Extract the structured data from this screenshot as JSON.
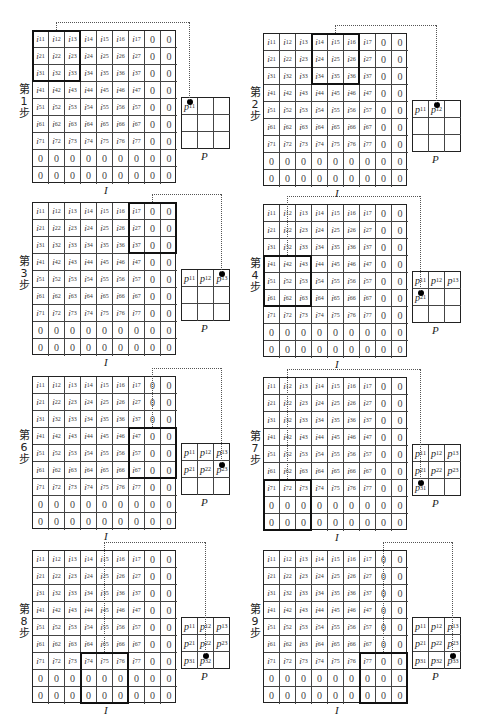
{
  "matrix": {
    "rows": [
      [
        "i11",
        "i12",
        "i13",
        "i14",
        "i15",
        "i16",
        "i17",
        "0",
        "0"
      ],
      [
        "i21",
        "i22",
        "i23",
        "i24",
        "i25",
        "i26",
        "i27",
        "0",
        "0"
      ],
      [
        "i31",
        "i32",
        "i33",
        "i34",
        "i35",
        "i36",
        "i37",
        "0",
        "0"
      ],
      [
        "i41",
        "i42",
        "i43",
        "i44",
        "i45",
        "i46",
        "i47",
        "0",
        "0"
      ],
      [
        "i51",
        "i52",
        "i53",
        "i54",
        "i55",
        "i56",
        "i57",
        "0",
        "0"
      ],
      [
        "i61",
        "i62",
        "i63",
        "i64",
        "i65",
        "i66",
        "i67",
        "0",
        "0"
      ],
      [
        "i71",
        "i72",
        "i73",
        "i74",
        "i75",
        "i76",
        "i77",
        "0",
        "0"
      ],
      [
        "0",
        "0",
        "0",
        "0",
        "0",
        "0",
        "0",
        "0",
        "0"
      ],
      [
        "0",
        "0",
        "0",
        "0",
        "0",
        "0",
        "0",
        "0",
        "0"
      ]
    ],
    "label": "I"
  },
  "pool": {
    "label": "P",
    "cells": [
      [
        "p11",
        "p12",
        "p13"
      ],
      [
        "p21",
        "p22",
        "p23"
      ],
      [
        "p31",
        "p32",
        "p33"
      ]
    ]
  },
  "panels": [
    {
      "step_label": "第1步",
      "step_num": "1",
      "window_row": 0,
      "window_col": 0,
      "filled": 1,
      "dot": [
        0,
        0
      ],
      "x": 0,
      "y": 30
    },
    {
      "step_label": "第2步",
      "step_num": "2",
      "window_row": 0,
      "window_col": 3,
      "filled": 2,
      "dot": [
        0,
        1
      ],
      "x": 231,
      "y": 33
    },
    {
      "step_label": "第3步",
      "step_num": "3",
      "window_row": 0,
      "window_col": 6,
      "filled": 3,
      "dot": [
        0,
        2
      ],
      "x": 0,
      "y": 202
    },
    {
      "step_label": "第4步",
      "step_num": "4",
      "window_row": 3,
      "window_col": 0,
      "filled": 4,
      "dot": [
        1,
        0
      ],
      "x": 231,
      "y": 204
    },
    {
      "step_label": "第6步",
      "step_num": "6",
      "window_row": 3,
      "window_col": 6,
      "filled": 6,
      "dot": [
        1,
        2
      ],
      "x": 0,
      "y": 376
    },
    {
      "step_label": "第7步",
      "step_num": "7",
      "window_row": 6,
      "window_col": 0,
      "filled": 7,
      "dot": [
        2,
        0
      ],
      "x": 231,
      "y": 377
    },
    {
      "step_label": "第8步",
      "step_num": "8",
      "window_row": 6,
      "window_col": 3,
      "filled": 8,
      "dot": [
        2,
        1
      ],
      "x": 0,
      "y": 550
    },
    {
      "step_label": "第9步",
      "step_num": "9",
      "window_row": 6,
      "window_col": 6,
      "filled": 9,
      "dot": [
        2,
        2
      ],
      "x": 231,
      "y": 550
    }
  ],
  "colors": {
    "line": "#222222",
    "window": "#111111",
    "dot": "#000000",
    "background": "#ffffff"
  }
}
